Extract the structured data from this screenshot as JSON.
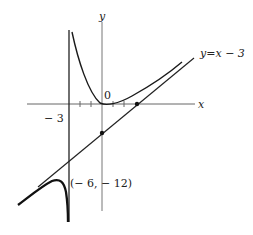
{
  "figure": {
    "labels": {
      "x_axis": "x",
      "y_axis": "y",
      "origin": "0",
      "vertical_asymptote": "− 3",
      "oblique_asymptote": "y=x − 3",
      "local_max_point": "(− 6, − 12)"
    },
    "colors": {
      "curve": "#1a1a1a",
      "axes": "#555555",
      "background": "#ffffff"
    }
  }
}
